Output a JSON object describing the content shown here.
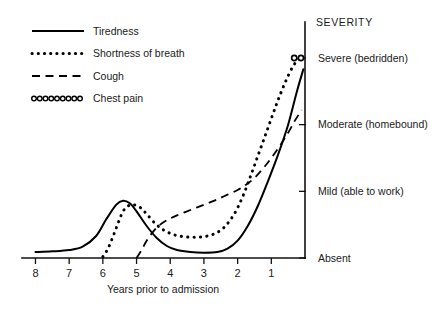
{
  "chart_data": {
    "type": "line",
    "title": "",
    "xlabel": "Years prior to admission",
    "ylabel": "SEVERITY",
    "x_ticks": [
      "8",
      "7",
      "6",
      "5",
      "4",
      "3",
      "2",
      "1"
    ],
    "x_tick_values": [
      8,
      7,
      6,
      5,
      4,
      3,
      2,
      1
    ],
    "x_axis_reversed": true,
    "xlim": [
      8.4,
      0.0
    ],
    "y_ticks": [
      "Absent",
      "Mild (able to work)",
      "Moderate (homebound)",
      "Severe (bedridden)"
    ],
    "y_tick_values": [
      0,
      1,
      2,
      3
    ],
    "ylim": [
      0,
      3.5
    ],
    "grid": false,
    "legend_position": "top-left",
    "series": [
      {
        "name": "Tiredness",
        "style": "solid",
        "x": [
          8.0,
          7.5,
          7.0,
          6.6,
          6.2,
          5.9,
          5.6,
          5.4,
          5.2,
          5.0,
          4.7,
          4.4,
          4.1,
          3.8,
          3.4,
          3.0,
          2.6,
          2.3,
          2.0,
          1.7,
          1.4,
          1.1,
          0.8,
          0.5,
          0.25,
          0.05
        ],
        "y": [
          0.09,
          0.1,
          0.12,
          0.17,
          0.33,
          0.58,
          0.8,
          0.86,
          0.82,
          0.7,
          0.48,
          0.3,
          0.18,
          0.12,
          0.09,
          0.08,
          0.09,
          0.14,
          0.26,
          0.48,
          0.78,
          1.15,
          1.55,
          2.0,
          2.48,
          2.83
        ]
      },
      {
        "name": "Shortness of breath",
        "style": "dotted",
        "x": [
          6.0,
          5.85,
          5.7,
          5.55,
          5.4,
          5.25,
          5.1,
          4.9,
          4.7,
          4.45,
          4.2,
          3.9,
          3.6,
          3.3,
          3.0,
          2.7,
          2.4,
          2.1,
          1.85,
          1.6,
          1.35,
          1.1,
          0.85,
          0.6,
          0.35,
          0.12
        ],
        "y": [
          0.02,
          0.14,
          0.32,
          0.52,
          0.7,
          0.78,
          0.8,
          0.76,
          0.66,
          0.52,
          0.42,
          0.35,
          0.32,
          0.31,
          0.32,
          0.36,
          0.46,
          0.66,
          0.92,
          1.25,
          1.6,
          1.95,
          2.3,
          2.62,
          2.88,
          3.02
        ]
      },
      {
        "name": "Cough",
        "style": "dashed",
        "x": [
          5.0,
          4.85,
          4.7,
          4.5,
          4.3,
          4.05,
          3.8,
          3.5,
          3.2,
          2.9,
          2.6,
          2.3,
          2.0,
          1.75,
          1.5,
          1.25,
          1.0,
          0.75,
          0.5,
          0.3,
          0.1
        ],
        "y": [
          0.0,
          0.12,
          0.26,
          0.4,
          0.5,
          0.58,
          0.64,
          0.7,
          0.76,
          0.82,
          0.88,
          0.95,
          1.02,
          1.1,
          1.2,
          1.34,
          1.5,
          1.68,
          1.88,
          2.06,
          2.22
        ]
      },
      {
        "name": "Chest pain",
        "style": "circles",
        "x": [
          0.32,
          0.12
        ],
        "y": [
          3.0,
          3.0
        ]
      }
    ]
  },
  "legend": {
    "items": [
      {
        "label": "Tiredness",
        "style": "solid"
      },
      {
        "label": "Shortness of breath",
        "style": "dotted"
      },
      {
        "label": "Cough",
        "style": "dashed"
      },
      {
        "label": "Chest pain",
        "style": "circles"
      }
    ]
  },
  "axes": {
    "severity_title": "SEVERITY",
    "x_title": "Years prior to admission",
    "severity_levels": [
      {
        "label": "Severe (bedridden)",
        "value": 3
      },
      {
        "label": "Moderate (homebound)",
        "value": 2
      },
      {
        "label": "Mild (able to work)",
        "value": 1
      },
      {
        "label": "Absent",
        "value": 0
      }
    ],
    "x_labels": [
      "8",
      "7",
      "6",
      "5",
      "4",
      "3",
      "2",
      "1"
    ]
  },
  "colors": {
    "ink": "#000000",
    "background": "#ffffff",
    "text": "#1a1a1a"
  }
}
